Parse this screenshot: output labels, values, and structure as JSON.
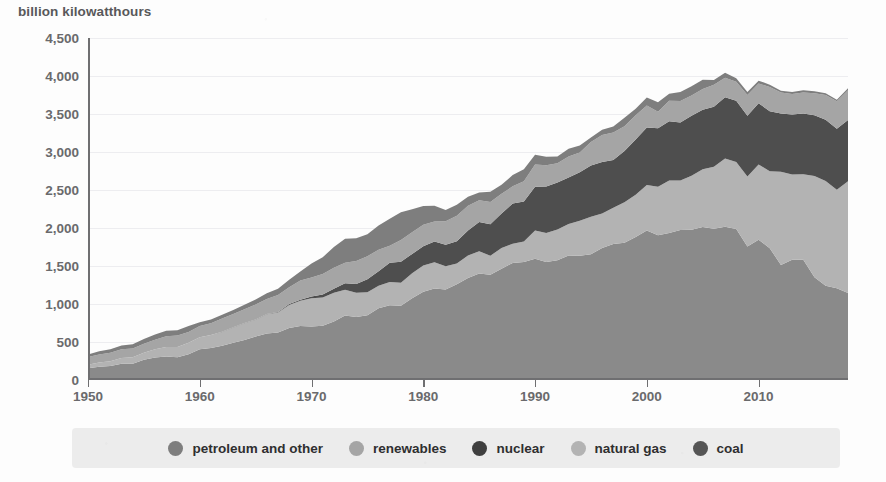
{
  "chart_data": {
    "type": "area",
    "title": "billion kilowatthours",
    "subtitle": "",
    "xlabel": "",
    "ylabel": "billion kilowatthours",
    "xlim": [
      1950,
      2018
    ],
    "ylim": [
      0,
      4500
    ],
    "grid": true,
    "stacked": true,
    "legend_position": "bottom",
    "yticks": [
      "0",
      "500",
      "1,000",
      "1,500",
      "2,000",
      "2,500",
      "3,000",
      "3,500",
      "4,000",
      "4,500"
    ],
    "ytick_values": [
      0,
      500,
      1000,
      1500,
      2000,
      2500,
      3000,
      3500,
      4000,
      4500
    ],
    "xticks": [
      "1950",
      "1960",
      "1970",
      "1980",
      "1990",
      "2000",
      "2010"
    ],
    "xtick_values": [
      1950,
      1960,
      1970,
      1980,
      1990,
      2000,
      2010
    ],
    "x": [
      1950,
      1951,
      1952,
      1953,
      1954,
      1955,
      1956,
      1957,
      1958,
      1959,
      1960,
      1961,
      1962,
      1963,
      1964,
      1965,
      1966,
      1967,
      1968,
      1969,
      1970,
      1971,
      1972,
      1973,
      1974,
      1975,
      1976,
      1977,
      1978,
      1979,
      1980,
      1981,
      1982,
      1983,
      1984,
      1985,
      1986,
      1987,
      1988,
      1989,
      1990,
      1991,
      1992,
      1993,
      1994,
      1995,
      1996,
      1997,
      1998,
      1999,
      2000,
      2001,
      2002,
      2003,
      2004,
      2005,
      2006,
      2007,
      2008,
      2009,
      2010,
      2011,
      2012,
      2013,
      2014,
      2015,
      2016,
      2017,
      2018
    ],
    "series": [
      {
        "name": "coal",
        "color": "#8a8a8a",
        "stack_order": 1,
        "values": [
          155,
          175,
          185,
          215,
          215,
          265,
          295,
          310,
          300,
          340,
          403,
          422,
          450,
          489,
          526,
          571,
          613,
          626,
          684,
          710,
          704,
          713,
          771,
          848,
          828,
          853,
          944,
          985,
          976,
          1075,
          1162,
          1203,
          1192,
          1259,
          1342,
          1402,
          1386,
          1464,
          1541,
          1554,
          1594,
          1551,
          1576,
          1639,
          1635,
          1653,
          1737,
          1788,
          1807,
          1881,
          1966,
          1904,
          1933,
          1974,
          1978,
          2013,
          1991,
          2016,
          1986,
          1756,
          1847,
          1733,
          1514,
          1581,
          1582,
          1352,
          1239,
          1206,
          1146
        ]
      },
      {
        "name": "natural gas",
        "color": "#b3b3b3",
        "stack_order": 2,
        "values": [
          45,
          55,
          62,
          75,
          85,
          95,
          110,
          125,
          135,
          150,
          158,
          169,
          183,
          202,
          221,
          222,
          251,
          262,
          302,
          333,
          373,
          374,
          376,
          341,
          320,
          300,
          295,
          306,
          305,
          329,
          346,
          346,
          305,
          274,
          297,
          292,
          249,
          273,
          253,
          267,
          373,
          382,
          404,
          415,
          460,
          496,
          455,
          479,
          531,
          556,
          601,
          639,
          691,
          650,
          710,
          761,
          816,
          897,
          883,
          921,
          988,
          1013,
          1225,
          1124,
          1126,
          1333,
          1378,
          1296,
          1468
        ]
      },
      {
        "name": "nuclear",
        "color": "#4e4e4e",
        "stack_order": 3,
        "values": [
          0,
          0,
          0,
          0,
          0,
          0,
          0,
          0,
          0,
          0,
          1,
          2,
          2,
          3,
          3,
          4,
          6,
          8,
          13,
          14,
          22,
          38,
          54,
          83,
          114,
          173,
          191,
          251,
          276,
          255,
          251,
          273,
          283,
          294,
          328,
          384,
          414,
          455,
          527,
          529,
          577,
          613,
          619,
          610,
          640,
          673,
          675,
          629,
          674,
          728,
          754,
          769,
          780,
          764,
          789,
          782,
          787,
          806,
          806,
          799,
          807,
          790,
          769,
          789,
          797,
          797,
          806,
          805,
          807
        ]
      },
      {
        "name": "renewables",
        "color": "#a5a5a5",
        "stack_order": 4,
        "values": [
          101,
          107,
          111,
          113,
          113,
          118,
          126,
          142,
          149,
          143,
          149,
          155,
          174,
          173,
          180,
          197,
          195,
          222,
          223,
          253,
          251,
          270,
          275,
          272,
          304,
          303,
          284,
          223,
          284,
          285,
          284,
          264,
          310,
          334,
          325,
          288,
          293,
          258,
          227,
          265,
          293,
          280,
          254,
          278,
          260,
          310,
          358,
          361,
          328,
          318,
          290,
          217,
          270,
          283,
          268,
          272,
          290,
          257,
          248,
          275,
          260,
          320,
          276,
          268,
          279,
          290,
          326,
          361,
          392
        ]
      },
      {
        "name": "petroleum and other",
        "color": "#7e7e7e",
        "stack_order": 5,
        "values": [
          34,
          40,
          46,
          52,
          56,
          60,
          68,
          72,
          70,
          76,
          48,
          49,
          50,
          55,
          60,
          65,
          76,
          84,
          96,
          118,
          184,
          220,
          274,
          314,
          300,
          289,
          320,
          358,
          365,
          304,
          246,
          206,
          147,
          144,
          120,
          100,
          136,
          118,
          149,
          158,
          126,
          111,
          89,
          100,
          91,
          60,
          67,
          77,
          110,
          86,
          106,
          125,
          94,
          119,
          121,
          122,
          64,
          66,
          46,
          38,
          37,
          30,
          23,
          27,
          30,
          28,
          24,
          21,
          25
        ]
      }
    ],
    "legend": [
      {
        "label": "petroleum and other",
        "color": "#7e7e7e"
      },
      {
        "label": "renewables",
        "color": "#a5a5a5"
      },
      {
        "label": "nuclear",
        "color": "#3f3f3f"
      },
      {
        "label": "natural gas",
        "color": "#b3b3b3"
      },
      {
        "label": "coal",
        "color": "#555555"
      }
    ]
  },
  "colors": {
    "background": "#fdfdfd",
    "legend_background": "#ececec",
    "axis": "#6f6f71",
    "grid": "#ededf0",
    "tick_text": "#6a6a6c",
    "title_text": "#58585a",
    "legend_text": "#2f2f30"
  }
}
